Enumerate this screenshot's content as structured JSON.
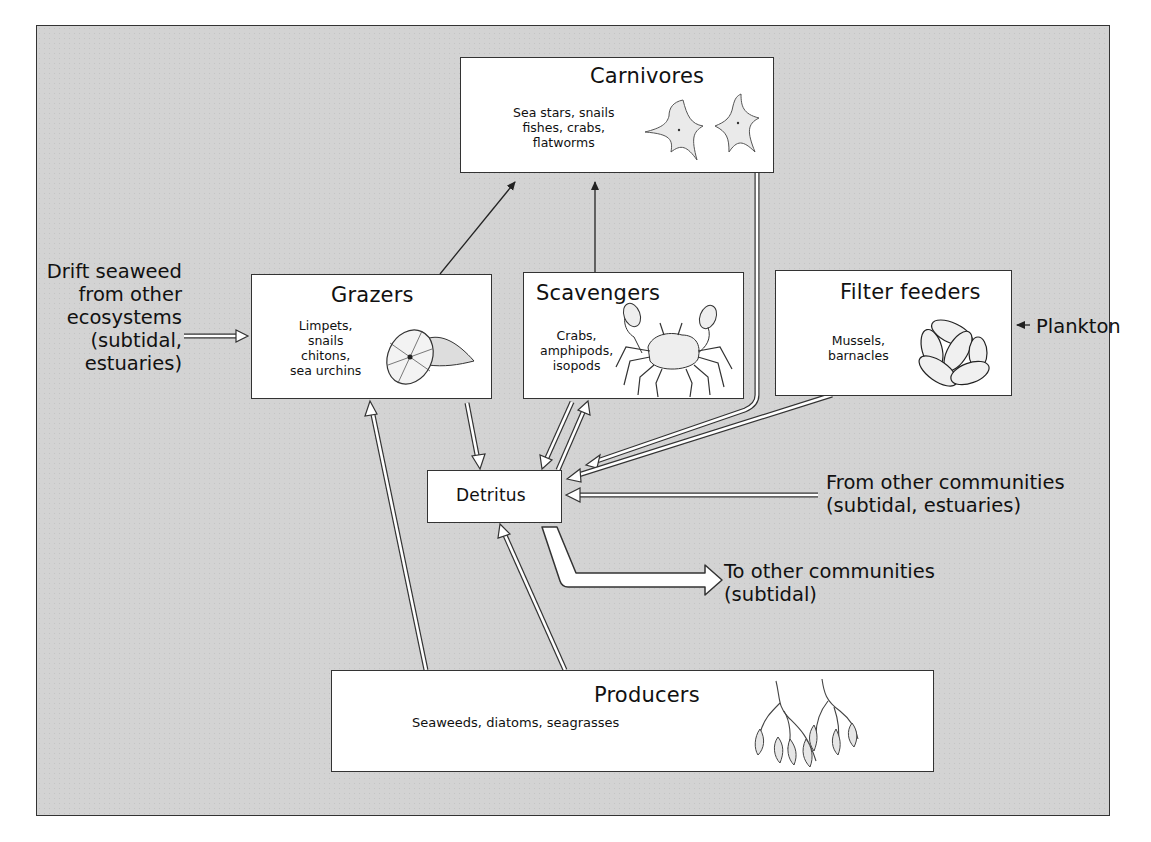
{
  "diagram": {
    "type": "food-web",
    "nodes": {
      "carnivores": {
        "title": "Carnivores",
        "members": [
          "Sea stars, snails",
          "fishes, crabs,",
          "flatworms"
        ],
        "illustration": "sea-star-icon"
      },
      "grazers": {
        "title": "Grazers",
        "members": [
          "Limpets,",
          "snails",
          "chitons,",
          "sea urchins"
        ],
        "illustration": "limpet-shell-icon"
      },
      "scavengers": {
        "title": "Scavengers",
        "members": [
          "Crabs,",
          "amphipods,",
          "isopods"
        ],
        "illustration": "crab-icon"
      },
      "filter_feeders": {
        "title": "Filter feeders",
        "members": [
          "Mussels,",
          "barnacles"
        ],
        "illustration": "mussel-cluster-icon"
      },
      "detritus": {
        "title": "Detritus"
      },
      "producers": {
        "title": "Producers",
        "members": [
          "Seaweeds, diatoms, seagrasses"
        ],
        "illustration": "seaweed-icon"
      }
    },
    "external_inputs": {
      "drift_seaweed": [
        "Drift seaweed",
        "from other",
        "ecosystems",
        "(subtidal,",
        "estuaries)"
      ],
      "plankton": "Plankton",
      "from_other_communities": [
        "From other communities",
        "(subtidal, estuaries)"
      ],
      "to_other_communities": [
        "To other communities",
        "(subtidal)"
      ]
    },
    "edges": [
      {
        "from": "grazers",
        "to": "carnivores",
        "style": "line-arrow"
      },
      {
        "from": "scavengers",
        "to": "carnivores",
        "style": "line-arrow"
      },
      {
        "from": "carnivores",
        "to": "detritus",
        "style": "hollow-arrow"
      },
      {
        "from": "filter_feeders",
        "to": "detritus",
        "style": "hollow-arrow"
      },
      {
        "from": "grazers",
        "to": "detritus",
        "style": "hollow-arrow"
      },
      {
        "from": "scavengers",
        "to": "detritus",
        "style": "hollow-arrow"
      },
      {
        "from": "detritus",
        "to": "scavengers",
        "style": "hollow-arrow"
      },
      {
        "from": "producers",
        "to": "grazers",
        "style": "hollow-arrow"
      },
      {
        "from": "producers",
        "to": "detritus",
        "style": "hollow-arrow"
      },
      {
        "from": "drift_seaweed",
        "to": "grazers",
        "style": "hollow-arrow"
      },
      {
        "from": "plankton",
        "to": "filter_feeders",
        "style": "line-arrow"
      },
      {
        "from": "from_other_communities",
        "to": "detritus",
        "style": "hollow-arrow"
      },
      {
        "from": "detritus",
        "to": "to_other_communities",
        "style": "wide-hollow-arrow"
      }
    ],
    "colors": {
      "background": "#d3d3d3",
      "box_fill": "#ffffff",
      "stroke": "#333333"
    }
  }
}
